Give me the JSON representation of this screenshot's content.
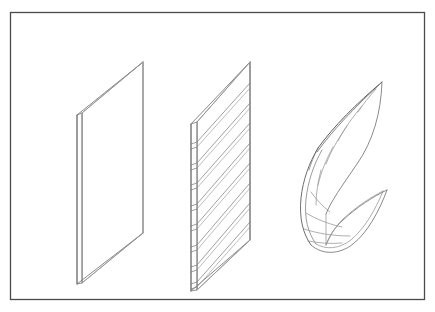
{
  "figure": {
    "background_color": "#ffffff",
    "line_color": "#808080",
    "dark_line_color": "#3c3c3c",
    "frame": {
      "name": "outer-border",
      "x": 10,
      "y": 12,
      "width": 415,
      "height": 288,
      "stroke": "#4a4a4a",
      "stroke_width": 1.3
    },
    "panels": [
      {
        "index": 1,
        "name": "flat-plate-panel",
        "label": "Flat plate",
        "type": "flat",
        "slat_count": 0,
        "face": {
          "points": "82,113 143,62 143,233 82,283"
        },
        "thickness_strip": {
          "points": "77,115 82,113 82,283 77,284"
        },
        "edges": [
          "77,115 143,62",
          "143,62 143,233",
          "143,233 77,284",
          "77,284 77,115",
          "82,113 82,283",
          "82,113 143,62",
          "82,283 143,233"
        ]
      },
      {
        "index": 2,
        "name": "slatted-panel",
        "label": "Slatted louver panel",
        "type": "slatted",
        "slat_count": 8,
        "face": {
          "points": "197,122 250,62 250,240 197,290"
        },
        "thickness_strip": {
          "points": "191,124 197,122 197,290 191,291"
        },
        "edges": [
          "191,124 250,62",
          "250,62 250,240",
          "250,240 191,291",
          "191,291 191,124",
          "197,122 197,290",
          "197,122 250,62",
          "197,290 250,240"
        ],
        "slats": [
          {
            "y_left": 142,
            "y_right": 83
          },
          {
            "y_left": 163,
            "y_right": 103
          },
          {
            "y_left": 183,
            "y_right": 123
          },
          {
            "y_left": 204,
            "y_right": 143
          },
          {
            "y_left": 224,
            "y_right": 163
          },
          {
            "y_left": 245,
            "y_right": 183
          },
          {
            "y_left": 265,
            "y_right": 203
          },
          {
            "y_left": 282,
            "y_right": 222
          }
        ],
        "slat_band_height": 5
      },
      {
        "index": 3,
        "name": "curved-warped-panel",
        "label": "Curved warped panel",
        "type": "curved",
        "slat_count": 9,
        "apex": {
          "x": 382,
          "y": 82
        },
        "left_curve": "M 382,82 C 340,118 312,152 304,196 C 300,219 304,234 311,244",
        "left_curve_inner": "M 378,85 C 338,122 316,154 309,196 C 305,219 309,233 316,243",
        "right_curve": "M 382,82 C 380,112 372,140 356,163 C 340,186 330,200 325,213",
        "bottom_edge": "M 311,244 C 322,254 338,254 352,243 C 366,232 378,212 386,190",
        "right_lower": "M 386,190 C 374,196 356,206 342,219 C 333,227 328,236 325,244",
        "slats": [
          {
            "start": "378,86",
            "end": "372,104"
          },
          {
            "start": "365,104",
            "end": "355,134"
          },
          {
            "start": "349,124",
            "end": "341,158"
          },
          {
            "start": "334,145",
            "end": "331,179"
          },
          {
            "start": "322,167",
            "end": "325,198"
          },
          {
            "start": "313,190",
            "end": "326,214"
          },
          {
            "start": "307,212",
            "end": "334,228"
          },
          {
            "start": "305,228",
            "end": "345,238"
          },
          {
            "start": "309,240",
            "end": "358,238"
          }
        ]
      }
    ]
  }
}
